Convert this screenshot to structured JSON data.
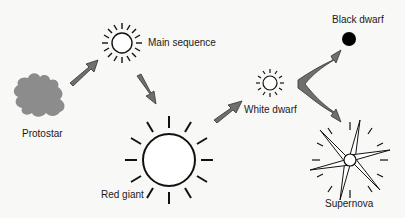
{
  "diagram": {
    "type": "stellar-evolution-flow",
    "colors": {
      "background": "#f8f8f6",
      "ink": "#111111",
      "arrow_fill": "#6f6f6f",
      "arrow_stroke": "#333333",
      "protostar_fill": "#8c8c8c",
      "black_dwarf": "#000000"
    },
    "nodes": [
      {
        "id": "protostar",
        "label": "Protostar",
        "icon": "cloud-blob-icon"
      },
      {
        "id": "main-sequence",
        "label": "Main sequence",
        "icon": "sun-icon"
      },
      {
        "id": "red-giant",
        "label": "Red giant",
        "icon": "large-sun-icon"
      },
      {
        "id": "white-dwarf",
        "label": "White dwarf",
        "icon": "small-sun-icon"
      },
      {
        "id": "black-dwarf",
        "label": "Black dwarf",
        "icon": "filled-circle-icon"
      },
      {
        "id": "supernova",
        "label": "Supernova",
        "icon": "starburst-icon"
      }
    ],
    "edges": [
      {
        "from": "protostar",
        "to": "main-sequence"
      },
      {
        "from": "main-sequence",
        "to": "red-giant"
      },
      {
        "from": "red-giant",
        "to": "white-dwarf"
      },
      {
        "from": "white-dwarf",
        "to": "black-dwarf"
      },
      {
        "from": "white-dwarf",
        "to": "supernova"
      }
    ]
  }
}
